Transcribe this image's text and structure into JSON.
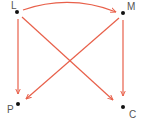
{
  "diagram": {
    "edge_color": "#e8604a",
    "node_color": "#111111",
    "label_color": "#555555",
    "nodes": [
      {
        "id": "L",
        "label": "L",
        "x": 17,
        "y": 12,
        "label_x": 11,
        "label_y": 9
      },
      {
        "id": "M",
        "label": "M",
        "x": 123,
        "y": 13,
        "label_x": 127,
        "label_y": 10
      },
      {
        "id": "P",
        "label": "P",
        "x": 18,
        "y": 104,
        "label_x": 7,
        "label_y": 113
      },
      {
        "id": "C",
        "label": "C",
        "x": 123,
        "y": 107,
        "label_x": 129,
        "label_y": 118
      }
    ],
    "edges": [
      {
        "from": "L",
        "to": "M",
        "curved": true
      },
      {
        "from": "L",
        "to": "P",
        "curved": false
      },
      {
        "from": "L",
        "to": "C",
        "curved": false
      },
      {
        "from": "M",
        "to": "P",
        "curved": false
      },
      {
        "from": "M",
        "to": "C",
        "curved": false
      }
    ]
  }
}
